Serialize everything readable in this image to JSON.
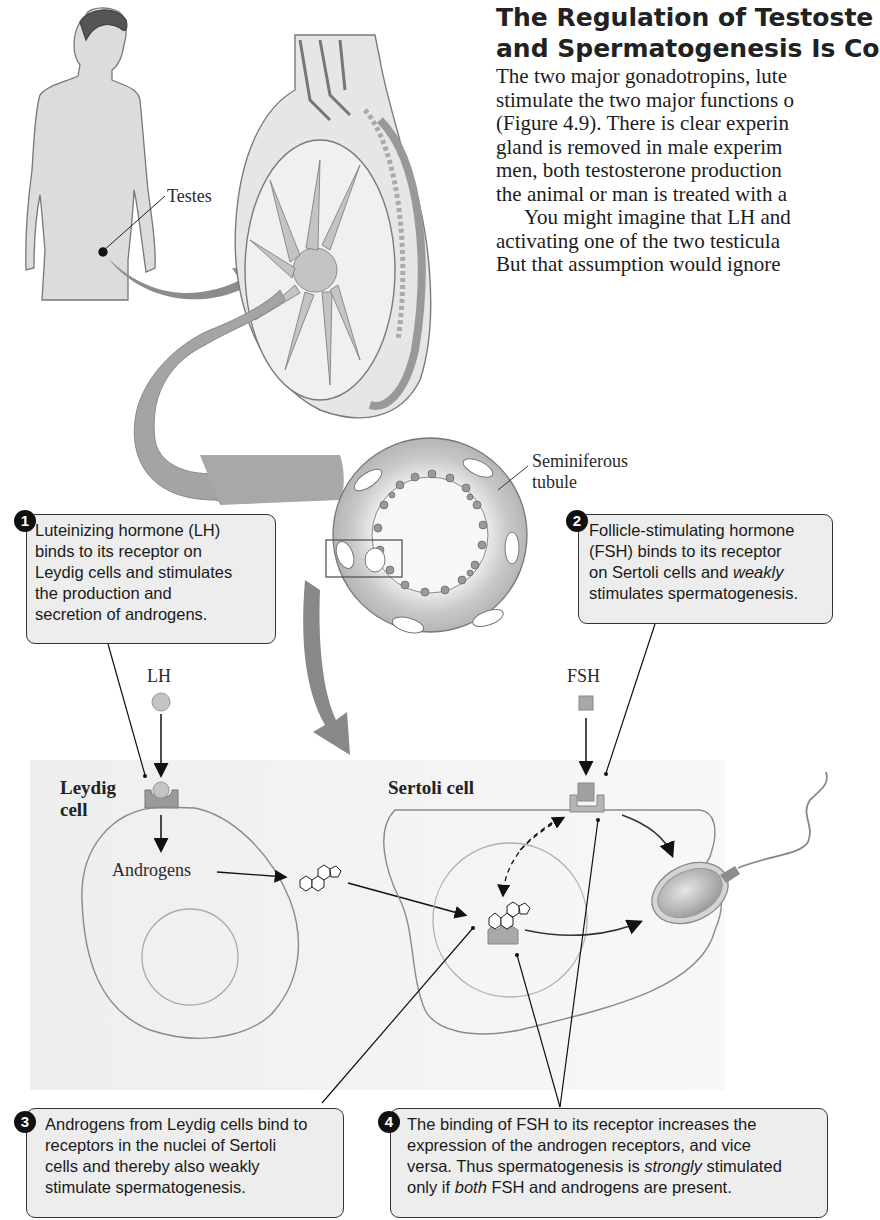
{
  "heading": {
    "line1": "The Regulation of Testoste",
    "line2": "and Spermatogenesis Is Co"
  },
  "body_text": {
    "lines": [
      "The two major gonadotropins, lute",
      "stimulate the two major functions o",
      "(Figure 4.9). There is clear experin",
      "gland is removed in male experim",
      "men, both testosterone production",
      "the animal or man is treated with a",
      "You might imagine that LH and",
      "activating one of the two testicula",
      "But that assumption would ignore"
    ]
  },
  "figure": {
    "labels": {
      "testes": "Testes",
      "seminiferous_line1": "Seminiferous",
      "seminiferous_line2": "tubule",
      "lh": "LH",
      "fsh": "FSH",
      "leydig_line1": "Leydig",
      "leydig_line2": "cell",
      "sertoli": "Sertoli cell",
      "androgens": "Androgens"
    },
    "callouts": [
      {
        "number": "1",
        "lines": [
          "Luteinizing hormone (LH)",
          "binds to its receptor on",
          "Leydig cells and stimulates",
          "the production and",
          "secretion of androgens."
        ]
      },
      {
        "number": "2",
        "lines": [
          "Follicle-stimulating hormone",
          "(FSH) binds to its receptor",
          "on Sertoli cells and",
          "weakly",
          "stimulates spermatogenesis."
        ]
      },
      {
        "number": "3",
        "lines": [
          "Androgens from Leydig cells bind to",
          "receptors in the nuclei of Sertoli",
          "cells and thereby also weakly",
          "stimulate spermatogenesis."
        ]
      },
      {
        "number": "4",
        "lines": [
          "The binding of FSH to its receptor increases the",
          "expression of the androgen receptors, and vice",
          "versa. Thus spermatogenesis is",
          "strongly",
          "stimulated",
          "only if",
          "both",
          "FSH and androgens are present."
        ]
      }
    ],
    "colors": {
      "hormone_fill": "#bdbdbd",
      "receptor_fill": "#9a9a9a",
      "cell_outline": "#8a8a8a",
      "tubule_fill": "#a8a8a8",
      "callout_bg": "#ededed"
    }
  }
}
